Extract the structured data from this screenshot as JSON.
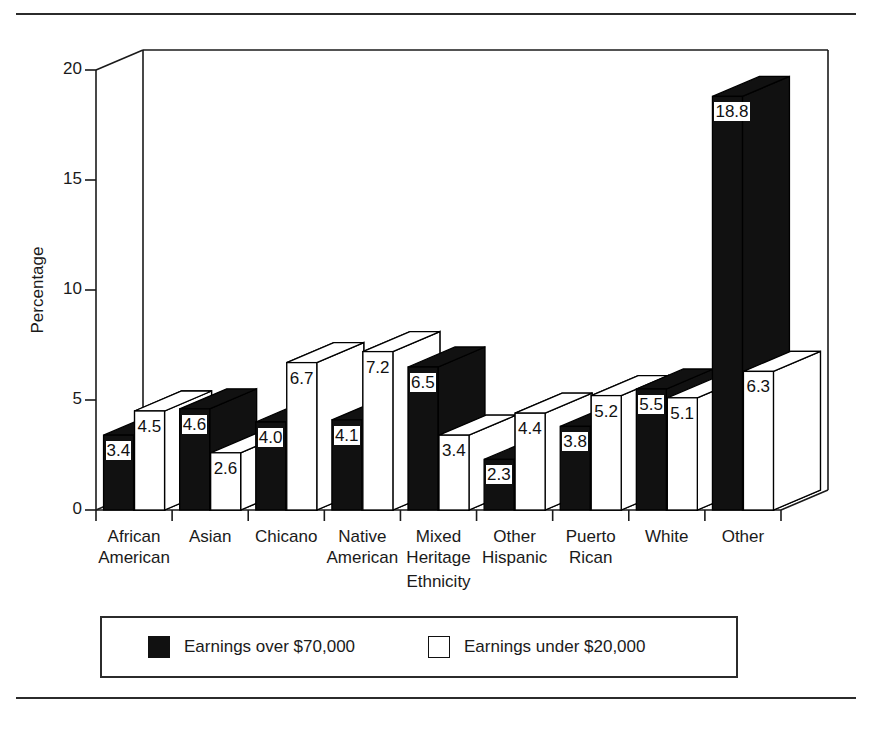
{
  "figure": {
    "has_top_rule": true,
    "has_bottom_rule": true,
    "background_color": "#ffffff",
    "ink_color": "#1a1a1a"
  },
  "axes": {
    "ylabel": "Percentage",
    "xlabel": "Ethnicity",
    "yticks": [
      "0",
      "5",
      "10",
      "15",
      "20"
    ],
    "ymin": 0,
    "ymax": 20
  },
  "legend": {
    "entries": [
      {
        "label": "Earnings over $70,000",
        "swatch": "dark",
        "color": "#111111"
      },
      {
        "label": "Earnings under $20,000",
        "swatch": "light",
        "color": "#ffffff"
      }
    ]
  },
  "chart_data": {
    "type": "bar",
    "title": "",
    "xlabel": "Ethnicity",
    "ylabel": "Percentage",
    "ylim": [
      0,
      20
    ],
    "yticks": [
      0,
      5,
      10,
      15,
      20
    ],
    "grid": false,
    "legend_position": "bottom",
    "three_d": true,
    "categories": [
      "African\nAmerican",
      "Asian",
      "Chicano",
      "Native\nAmerican",
      "Mixed\nHeritage",
      "Other\nHispanic",
      "Puerto\nRican",
      "White",
      "Other"
    ],
    "series": [
      {
        "name": "Earnings over $70,000",
        "color": "#111111",
        "values": [
          3.4,
          4.6,
          4.0,
          4.1,
          6.5,
          2.3,
          3.8,
          5.5,
          18.8
        ],
        "labels": [
          "3.4",
          "4.6",
          "4.0",
          "4.1",
          "6.5",
          "2.3",
          "3.8",
          "5.5",
          "18.8"
        ]
      },
      {
        "name": "Earnings under $20,000",
        "color": "#ffffff",
        "values": [
          4.5,
          2.6,
          6.7,
          7.2,
          3.4,
          4.4,
          5.2,
          5.1,
          6.3
        ],
        "labels": [
          "4.5",
          "2.6",
          "6.7",
          "7.2",
          "3.4",
          "4.4",
          "5.2",
          "5.1",
          "6.3"
        ]
      }
    ]
  }
}
